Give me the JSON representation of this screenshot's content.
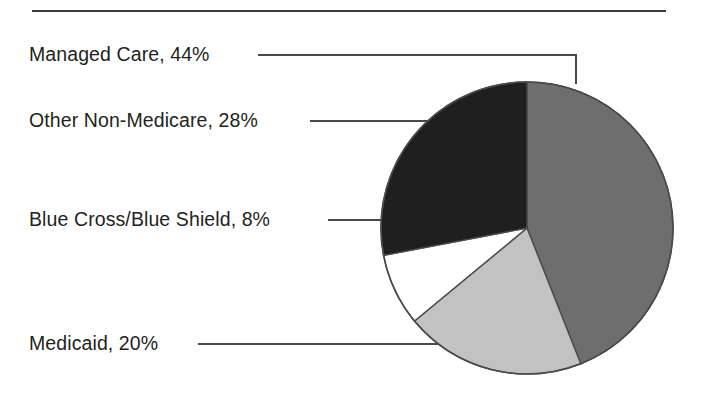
{
  "figure": {
    "background_color": "#ffffff",
    "rule_color": "#3a3a3a",
    "leader_line_color": "#4a4a4a",
    "text_color": "#231f20"
  },
  "labels": {
    "managed_care": "Managed Care, 44%",
    "other_non_medicare": "Other Non-Medicare, 28%",
    "blue_cross_blue_shield": "Blue Cross/Blue Shield, 8%",
    "medicaid": "Medicaid, 20%"
  },
  "chart_data": {
    "type": "pie",
    "title": "",
    "subtitle": "",
    "xlabel": "",
    "ylabel": "",
    "legend_position": "none",
    "labels_position": "external-with-leader-lines",
    "start_angle_deg": 0,
    "direction": "clockwise",
    "units": "percent",
    "total": 100,
    "categories": [
      "Managed Care",
      "Medicaid",
      "Blue Cross/Blue Shield",
      "Other Non-Medicare"
    ],
    "values": [
      44,
      20,
      8,
      28
    ],
    "slices": [
      {
        "name": "Managed Care",
        "value": 44,
        "label": "Managed Care, 44%",
        "color": "#6e6e6e",
        "start_deg": 0,
        "end_deg": 158.4
      },
      {
        "name": "Medicaid",
        "value": 20,
        "label": "Medicaid, 20%",
        "color": "#c2c2c2",
        "start_deg": 158.4,
        "end_deg": 230.4
      },
      {
        "name": "Blue Cross/Blue Shield",
        "value": 8,
        "label": "Blue Cross/Blue Shield, 8%",
        "color": "#ffffff",
        "start_deg": 230.4,
        "end_deg": 259.2
      },
      {
        "name": "Other Non-Medicare",
        "value": 28,
        "label": "Other Non-Medicare, 28%",
        "color": "#1f1f1f",
        "start_deg": 259.2,
        "end_deg": 360
      }
    ]
  }
}
